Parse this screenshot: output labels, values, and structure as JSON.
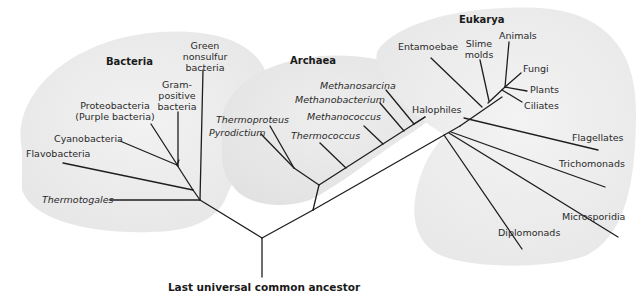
{
  "domains": {
    "bacteria": "Bacteria",
    "archaea": "Archaea",
    "eukarya": "Eukarya"
  },
  "root": {
    "label": "Last universal common ancestor"
  },
  "bacteria": {
    "taxa": [
      {
        "name": "Green nonsulfur bacteria",
        "lines": [
          "Green",
          "nonsulfur",
          "bacteria"
        ],
        "italic": false
      },
      {
        "name": "Gram-positive bacteria",
        "lines": [
          "Gram-",
          "positive",
          "bacteria"
        ],
        "italic": false
      },
      {
        "name": "Proteobacteria (Purple bacteria)",
        "lines": [
          "Proteobacteria",
          "(Purple bacteria)"
        ],
        "italic": false
      },
      {
        "name": "Cyanobacteria",
        "lines": [
          "Cyanobacteria"
        ],
        "italic": false
      },
      {
        "name": "Flavobacteria",
        "lines": [
          "Flavobacteria"
        ],
        "italic": false
      },
      {
        "name": "Thermotogales",
        "lines": [
          "Thermotogales"
        ],
        "italic": true
      }
    ]
  },
  "archaea": {
    "taxa": [
      {
        "name": "Thermoproteus",
        "italic": true
      },
      {
        "name": "Pyrodictium",
        "italic": true
      },
      {
        "name": "Thermococcus",
        "italic": true
      },
      {
        "name": "Methanococcus",
        "italic": true
      },
      {
        "name": "Methanobacterium",
        "italic": true
      },
      {
        "name": "Methanosarcina",
        "italic": true
      },
      {
        "name": "Halophiles",
        "italic": false
      }
    ]
  },
  "eukarya": {
    "taxa": [
      {
        "name": "Entamoebae"
      },
      {
        "name": "Slime molds",
        "lines": [
          "Slime",
          "molds"
        ]
      },
      {
        "name": "Animals"
      },
      {
        "name": "Fungi"
      },
      {
        "name": "Plants"
      },
      {
        "name": "Ciliates"
      },
      {
        "name": "Flagellates"
      },
      {
        "name": "Trichomonads"
      },
      {
        "name": "Microsporidia"
      },
      {
        "name": "Diplomonads"
      }
    ]
  },
  "colors": {
    "background": "#ffffff",
    "domain_blob": "#ececec",
    "branch": "#1e1e1e",
    "text": "#2a2a2a"
  }
}
